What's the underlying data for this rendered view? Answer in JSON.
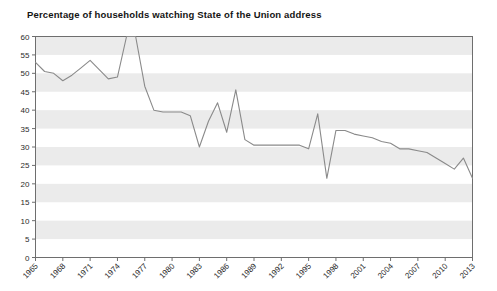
{
  "chart_data": {
    "type": "line",
    "title": "Percentage of households watching State of the Union address",
    "xlabel": "",
    "ylabel": "",
    "ylim": [
      0,
      60
    ],
    "xlim": [
      1965,
      2013
    ],
    "yticks": [
      0,
      5,
      10,
      15,
      20,
      25,
      30,
      35,
      40,
      45,
      50,
      55,
      60
    ],
    "xticks": [
      1965,
      1968,
      1971,
      1974,
      1977,
      1980,
      1983,
      1986,
      1989,
      1992,
      1995,
      1998,
      2001,
      2004,
      2007,
      2010,
      2013
    ],
    "xtick_labels": [
      "1965",
      "1968",
      "1971",
      "1974",
      "1977",
      "1980",
      "1983",
      "1986",
      "1989",
      "1992",
      "1995",
      "1998",
      "2001",
      "2004",
      "2007",
      "2010",
      "2013"
    ],
    "ytick_labels": [
      "0",
      "5",
      "10",
      "15",
      "20",
      "25",
      "30",
      "35",
      "40",
      "45",
      "50",
      "55",
      "60"
    ],
    "grid": "alternating-horizontal-bands",
    "legend": "none",
    "line_color": "#8a8a8a",
    "band_color": "#ebebeb",
    "axis_color": "#6e6e6e",
    "x": [
      1965,
      1966,
      1967,
      1968,
      1969,
      1970,
      1971,
      1972,
      1973,
      1974,
      1975,
      1976,
      1977,
      1978,
      1979,
      1980,
      1981,
      1982,
      1983,
      1984,
      1985,
      1986,
      1987,
      1988,
      1989,
      1990,
      1991,
      1992,
      1993,
      1994,
      1995,
      1996,
      1997,
      1998,
      1999,
      2000,
      2001,
      2002,
      2003,
      2004,
      2005,
      2006,
      2007,
      2008,
      2009,
      2010,
      2011,
      2012,
      2013
    ],
    "values": [
      53,
      50.5,
      50,
      48,
      49.5,
      51.5,
      53.5,
      51,
      48.5,
      49,
      60,
      60,
      46.5,
      40,
      39.5,
      39.5,
      39.5,
      38.5,
      30,
      37,
      42,
      34,
      45.5,
      32,
      30.5,
      30.5,
      30.5,
      30.5,
      30.5,
      30.5,
      29.5,
      39,
      21.5,
      34.5,
      34.5,
      33.5,
      33,
      32.5,
      31.5,
      31,
      29.5,
      29.5,
      29,
      28.5,
      27,
      25.5,
      24,
      27,
      21.5
    ],
    "series_name": "Percentage of households"
  },
  "page": {
    "title_text": "Percentage of households watching State of the Union address"
  }
}
